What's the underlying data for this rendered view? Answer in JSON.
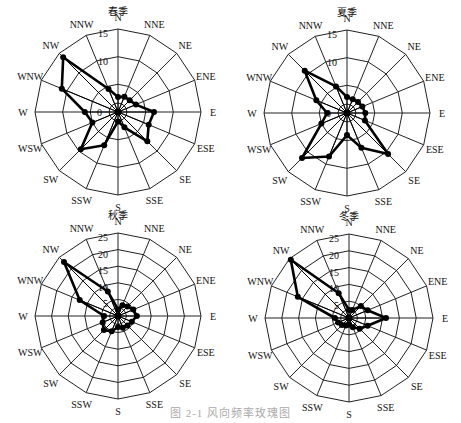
{
  "figure_caption": "图 2-1 风向频率玫瑰图",
  "chart_data": [
    {
      "type": "radar",
      "title": "春季",
      "directions": [
        "N",
        "NNE",
        "NE",
        "ENE",
        "E",
        "ESE",
        "SE",
        "SSE",
        "S",
        "SSW",
        "SW",
        "WSW",
        "W",
        "WNW",
        "NW",
        "NNW"
      ],
      "values": [
        2.7,
        3,
        3,
        3.5,
        6.5,
        6,
        7.5,
        3,
        1.7,
        6.5,
        9.5,
        5,
        6,
        11,
        14,
        4.5
      ],
      "rmax": 15,
      "ticks": [
        0,
        5,
        10,
        15
      ],
      "tick_labels": [
        "0",
        "",
        "10",
        "15"
      ],
      "center": [
        118,
        112
      ],
      "radius": 83
    },
    {
      "type": "radar",
      "title": "夏季",
      "directions": [
        "N",
        "NNE",
        "NE",
        "ENE",
        "E",
        "ESE",
        "SE",
        "SSE",
        "S",
        "SSW",
        "SW",
        "WSW",
        "W",
        "WNW",
        "NW",
        "NNW"
      ],
      "values": [
        2.9,
        2.7,
        2.8,
        3,
        3.3,
        3.5,
        10.5,
        6.8,
        4,
        8.5,
        11.5,
        5,
        3.6,
        6,
        10.8,
        5.2
      ],
      "rmax": 15,
      "ticks": [
        0,
        5,
        10,
        15
      ],
      "tick_labels": [
        "0",
        "",
        "10",
        "15"
      ],
      "center": [
        347,
        113
      ],
      "radius": 83
    },
    {
      "type": "radar",
      "title": "秋季",
      "directions": [
        "N",
        "NNE",
        "NE",
        "ENE",
        "E",
        "ESE",
        "SE",
        "SSE",
        "S",
        "SSW",
        "SW",
        "WSW",
        "W",
        "WNW",
        "NW",
        "NNW"
      ],
      "values": [
        2,
        3.5,
        4,
        5,
        5.7,
        4.5,
        4,
        3.8,
        3.3,
        5,
        6,
        5,
        4.2,
        12.5,
        23,
        8
      ],
      "rmax": 25,
      "ticks": [
        0,
        5,
        10,
        15,
        20,
        25
      ],
      "tick_labels": [
        "",
        "5",
        "10",
        "15",
        "20",
        "25"
      ],
      "center": [
        118,
        316
      ],
      "radius": 83
    },
    {
      "type": "radar",
      "title": "冬季",
      "directions": [
        "N",
        "NNE",
        "NE",
        "ENE",
        "E",
        "ESE",
        "SE",
        "SSE",
        "S",
        "SSW",
        "SW",
        "WSW",
        "W",
        "WNW",
        "NW",
        "NNW"
      ],
      "values": [
        2.4,
        2.6,
        5,
        6,
        11,
        6,
        4.5,
        3,
        2,
        2.4,
        3,
        3.5,
        4.2,
        16.5,
        24.5,
        8
      ],
      "rmax": 25,
      "ticks": [
        0,
        5,
        10,
        15,
        20,
        25
      ],
      "tick_labels": [
        "",
        "5",
        "10",
        "15",
        "20",
        "25"
      ],
      "center": [
        349,
        318
      ],
      "radius": 84
    }
  ]
}
